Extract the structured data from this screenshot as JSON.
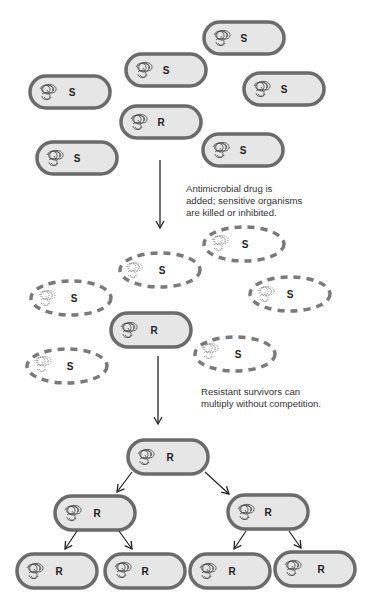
{
  "diagram": {
    "colors": {
      "cell_fill": "#e6e6e6",
      "cell_wall": "#6b6b6b",
      "dead_wall": "#7a7a7a",
      "arrow": "#222222",
      "text": "#222222"
    },
    "stage1": {
      "cells": [
        {
          "label": "S",
          "cx": 244,
          "cy": 38,
          "state": "alive",
          "flipped": true
        },
        {
          "label": "S",
          "cx": 166,
          "cy": 70,
          "state": "alive"
        },
        {
          "label": "S",
          "cx": 70,
          "cy": 92,
          "state": "alive"
        },
        {
          "label": "S",
          "cx": 284,
          "cy": 89,
          "state": "alive"
        },
        {
          "label": "R",
          "cx": 161,
          "cy": 122,
          "state": "alive"
        },
        {
          "label": "S",
          "cx": 77,
          "cy": 158,
          "state": "alive"
        },
        {
          "label": "S",
          "cx": 243,
          "cy": 150,
          "state": "alive"
        }
      ]
    },
    "step1_caption": [
      "Antimicrobial drug is",
      "added; sensitive organisms",
      "are killed or inhibited."
    ],
    "stage2": {
      "cells": [
        {
          "label": "S",
          "cx": 244,
          "cy": 244,
          "state": "dead"
        },
        {
          "label": "S",
          "cx": 160,
          "cy": 270,
          "state": "dead"
        },
        {
          "label": "S",
          "cx": 71,
          "cy": 298,
          "state": "dead"
        },
        {
          "label": "S",
          "cx": 290,
          "cy": 294,
          "state": "dead"
        },
        {
          "label": "R",
          "cx": 151,
          "cy": 330,
          "state": "alive"
        },
        {
          "label": "S",
          "cx": 67,
          "cy": 366,
          "state": "dead"
        },
        {
          "label": "S",
          "cx": 235,
          "cy": 354,
          "state": "dead"
        }
      ]
    },
    "step2_caption": [
      "Resistant survivors can",
      "multiply without competition."
    ],
    "stage3": {
      "generation1": [
        {
          "label": "R",
          "cx": 168,
          "cy": 457
        }
      ],
      "generation2": [
        {
          "label": "R",
          "cx": 95,
          "cy": 513
        },
        {
          "label": "R",
          "cx": 268,
          "cy": 512
        }
      ],
      "generation3": [
        {
          "label": "R",
          "cx": 57,
          "cy": 571
        },
        {
          "label": "R",
          "cx": 145,
          "cy": 571
        },
        {
          "label": "R",
          "cx": 230,
          "cy": 571
        },
        {
          "label": "R",
          "cx": 315,
          "cy": 569
        }
      ]
    }
  }
}
